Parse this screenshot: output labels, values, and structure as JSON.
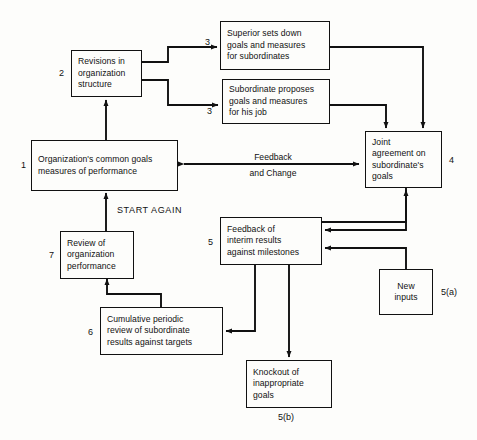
{
  "diagram": {
    "canvas": {
      "width": 477,
      "height": 440
    },
    "colors": {
      "ink": "#111111",
      "paper": "#fdfdfb"
    },
    "nodes": [
      {
        "id": "n2",
        "number": "2",
        "lines": [
          "Revisions in",
          "organization",
          "structure"
        ]
      },
      {
        "id": "n3a",
        "number": "3",
        "lines": [
          "Superior sets down",
          "goals and measures",
          "for subordinates"
        ]
      },
      {
        "id": "n3b",
        "number": "3",
        "lines": [
          "Subordinate proposes",
          "goals and measures",
          "for his job"
        ]
      },
      {
        "id": "n1",
        "number": "1",
        "lines": [
          "Organization's common goals",
          "measures of performance"
        ]
      },
      {
        "id": "n4",
        "number": "4",
        "lines": [
          "Joint",
          "agreement on",
          "subordinate's",
          "goals"
        ]
      },
      {
        "id": "n7",
        "number": "7",
        "lines": [
          "Review of",
          "organization",
          "performance"
        ]
      },
      {
        "id": "n5",
        "number": "5",
        "lines": [
          "Feedback of",
          "interim results",
          "against milestones"
        ]
      },
      {
        "id": "n6",
        "number": "6",
        "lines": [
          "Cumulative periodic",
          "review of subordinate",
          "results against targets"
        ]
      },
      {
        "id": "n5a",
        "number": "5(a)",
        "lines": [
          "New",
          "inputs"
        ]
      },
      {
        "id": "n5b",
        "number": "5(b)",
        "lines": [
          "Knockout of",
          "inappropriate",
          "goals"
        ]
      }
    ],
    "edge_labels": {
      "feedback_top": "Feedback",
      "feedback_bottom": "and Change",
      "start_again": "START AGAIN"
    }
  }
}
